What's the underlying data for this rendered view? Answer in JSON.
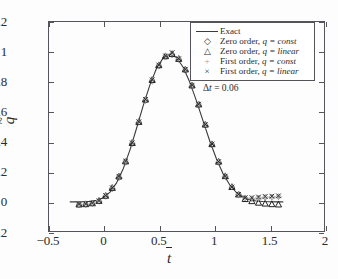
{
  "chart_data": {
    "type": "line",
    "title": "",
    "xlabel": "t̄",
    "ylabel": "q̃",
    "xlim": [
      -0.5,
      2
    ],
    "ylim": [
      -0.2,
      1.2
    ],
    "xticks": [
      -0.5,
      0,
      0.5,
      1,
      1.5,
      2
    ],
    "xticklabels": [
      "−0.5",
      "0",
      "0.5",
      "1",
      "1.5",
      "2"
    ],
    "yticks": [
      -0.2,
      0,
      0.2,
      0.4,
      0.6,
      0.8,
      1,
      1.2
    ],
    "yticklabels": [
      "−0.2",
      "0",
      "0.2",
      "0.4",
      "0.6",
      "0.8",
      "1",
      "1.2"
    ],
    "grid": false,
    "legend_position": "upper right",
    "annotation": "Δt = 0.06",
    "series": [
      {
        "name": "Exact",
        "marker": "line",
        "color": "#3a3a3a",
        "x": [
          -0.3,
          -0.24,
          -0.18,
          -0.12,
          -0.06,
          0.0,
          0.06,
          0.12,
          0.18,
          0.24,
          0.3,
          0.36,
          0.42,
          0.48,
          0.54,
          0.6,
          0.66,
          0.72,
          0.78,
          0.84,
          0.9,
          0.96,
          1.02,
          1.08,
          1.14,
          1.2,
          1.26,
          1.32,
          1.38,
          1.44,
          1.5,
          1.56,
          1.62
        ],
        "y": [
          0.0,
          0.0,
          0.001,
          0.003,
          0.01,
          0.028,
          0.065,
          0.128,
          0.222,
          0.345,
          0.49,
          0.64,
          0.776,
          0.886,
          0.955,
          0.98,
          0.958,
          0.893,
          0.793,
          0.67,
          0.536,
          0.404,
          0.286,
          0.187,
          0.113,
          0.062,
          0.031,
          0.014,
          0.006,
          0.002,
          0.001,
          0.0,
          0.0
        ]
      },
      {
        "name": "Zero order, q = const",
        "marker": "diamond",
        "color": "#8a8a8a",
        "x": [
          -0.22,
          -0.16,
          -0.1,
          -0.04,
          0.02,
          0.08,
          0.14,
          0.2,
          0.26,
          0.32,
          0.38,
          0.44,
          0.5,
          0.56,
          0.62,
          0.68,
          0.74,
          0.8,
          0.86,
          0.92,
          0.98,
          1.04,
          1.1,
          1.16,
          1.22,
          1.28,
          1.34,
          1.4,
          1.46,
          1.52,
          1.58
        ],
        "y": [
          -0.02,
          -0.018,
          -0.012,
          0.004,
          0.036,
          0.086,
          0.16,
          0.262,
          0.385,
          0.528,
          0.672,
          0.8,
          0.9,
          0.96,
          0.975,
          0.944,
          0.872,
          0.766,
          0.64,
          0.506,
          0.376,
          0.262,
          0.168,
          0.098,
          0.05,
          0.026,
          0.022,
          0.026,
          0.03,
          0.032,
          0.034
        ]
      },
      {
        "name": "Zero order, q = linear",
        "marker": "triangle",
        "color": "#1f1f1f",
        "x": [
          -0.22,
          -0.16,
          -0.1,
          -0.04,
          0.02,
          0.08,
          0.14,
          0.2,
          0.26,
          0.32,
          0.38,
          0.44,
          0.5,
          0.56,
          0.62,
          0.68,
          0.74,
          0.8,
          0.86,
          0.92,
          0.98,
          1.04,
          1.1,
          1.16,
          1.22,
          1.28,
          1.34,
          1.4,
          1.46,
          1.52,
          1.58
        ],
        "y": [
          -0.018,
          -0.016,
          -0.01,
          0.006,
          0.04,
          0.092,
          0.168,
          0.268,
          0.39,
          0.53,
          0.678,
          0.808,
          0.906,
          0.966,
          0.98,
          0.948,
          0.878,
          0.772,
          0.646,
          0.512,
          0.382,
          0.266,
          0.17,
          0.098,
          0.048,
          0.018,
          0.004,
          -0.006,
          -0.012,
          -0.016,
          -0.018
        ]
      },
      {
        "name": "First order, q = const",
        "marker": "plus",
        "color": "#a5a5a5",
        "x": [
          -0.22,
          -0.16,
          -0.1,
          -0.04,
          0.02,
          0.08,
          0.14,
          0.2,
          0.26,
          0.32,
          0.38,
          0.44,
          0.5,
          0.56,
          0.62,
          0.68,
          0.74,
          0.8,
          0.86,
          0.92,
          0.98,
          1.04,
          1.1,
          1.16,
          1.22,
          1.28,
          1.34,
          1.4,
          1.46,
          1.52,
          1.58
        ],
        "y": [
          -0.014,
          -0.012,
          -0.006,
          0.01,
          0.044,
          0.096,
          0.172,
          0.272,
          0.394,
          0.534,
          0.682,
          0.812,
          0.91,
          0.97,
          0.984,
          0.952,
          0.882,
          0.776,
          0.65,
          0.516,
          0.386,
          0.268,
          0.172,
          0.1,
          0.052,
          0.026,
          0.018,
          0.02,
          0.024,
          0.028,
          0.03
        ]
      },
      {
        "name": "First order, q = linear",
        "marker": "cross",
        "color": "#2b2b2b",
        "x": [
          -0.22,
          -0.16,
          -0.1,
          -0.04,
          0.02,
          0.08,
          0.14,
          0.2,
          0.26,
          0.32,
          0.38,
          0.44,
          0.5,
          0.56,
          0.62,
          0.68,
          0.74,
          0.8,
          0.86,
          0.92,
          0.98,
          1.04,
          1.1,
          1.16,
          1.22,
          1.28,
          1.34,
          1.4,
          1.46,
          1.52,
          1.58
        ],
        "y": [
          -0.016,
          -0.014,
          -0.008,
          0.008,
          0.042,
          0.094,
          0.17,
          0.27,
          0.392,
          0.532,
          0.68,
          0.81,
          0.908,
          0.968,
          0.99,
          0.95,
          0.88,
          0.774,
          0.648,
          0.514,
          0.384,
          0.267,
          0.171,
          0.099,
          0.05,
          0.028,
          0.028,
          0.032,
          0.036,
          0.038,
          0.04
        ]
      }
    ]
  },
  "axes": {
    "y_title": "q̃",
    "x_title": "t̄",
    "y_tick_labels": [
      "1.2",
      "1",
      "0.8",
      "0.6",
      "0.4",
      "0.2",
      "0",
      "−0.2"
    ],
    "y_tick_values": [
      1.2,
      1.0,
      0.8,
      0.6,
      0.4,
      0.2,
      0.0,
      -0.2
    ],
    "x_tick_labels": [
      "−0.5",
      "0",
      "0.5",
      "1",
      "1.5",
      "2"
    ],
    "x_tick_values": [
      -0.5,
      0,
      0.5,
      1,
      1.5,
      2
    ]
  },
  "legend": {
    "items": [
      {
        "symbol": "line",
        "label_main": "Exact",
        "label_eq": "",
        "label_val": ""
      },
      {
        "symbol": "◇",
        "label_main": "Zero order, ",
        "label_eq": "q",
        "label_val": " = const"
      },
      {
        "symbol": "△",
        "label_main": "Zero order, ",
        "label_eq": "q",
        "label_val": " = linear"
      },
      {
        "symbol": "+",
        "label_main": "First order, ",
        "label_eq": "q",
        "label_val": " = const"
      },
      {
        "symbol": "×",
        "label_main": "First order, ",
        "label_eq": "q",
        "label_val": " = linear"
      }
    ]
  },
  "annotation": {
    "delta_symbol": "Δ",
    "var": "t",
    "rest": " = 0.06",
    "full": "Δt = 0.06"
  },
  "colors": {
    "frame": "#54545a",
    "exact_line": "#3a3a3a",
    "diamond": "#8a8a8a",
    "triangle": "#1f1f1f",
    "plus": "#a5a5a5",
    "cross": "#2b2b2b",
    "background": "#fdfdfd"
  }
}
